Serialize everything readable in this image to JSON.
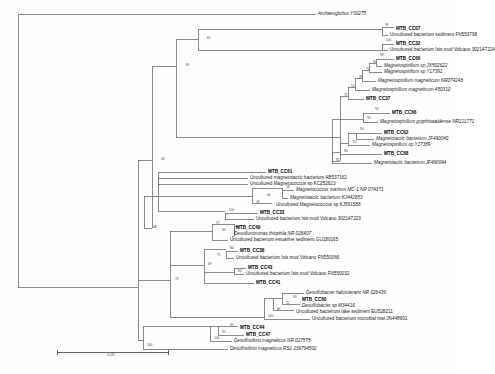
{
  "figure": {
    "type": "phylogenetic-tree",
    "title": "",
    "caption": "",
    "scale_bar": {
      "label": "0.05",
      "x1": 57,
      "x2": 168,
      "y": 352
    },
    "line_color": "#6e6e6e",
    "text_color": "#1a1a1a"
  },
  "chart_data": {
    "type": "tree",
    "title": "",
    "xlabel": "",
    "ylabel": "",
    "scale_bar_value": "0.05",
    "leaf_count": 34,
    "taxa": [
      {
        "id": "t1",
        "label": "Archaeoglobus Y00275",
        "bold": false,
        "italic": true,
        "x": 318,
        "y": 14
      },
      {
        "id": "t2",
        "label": "MTB_CC07",
        "bold": true,
        "italic": false,
        "x": 396,
        "y": 29
      },
      {
        "id": "t3",
        "label": "Uncultured bacterium sediment FN553798",
        "bold": false,
        "italic": false,
        "x": 390,
        "y": 35
      },
      {
        "id": "t4",
        "label": "MTB_CC32",
        "bold": true,
        "italic": false,
        "x": 396,
        "y": 44
      },
      {
        "id": "t5",
        "label": "Uncultured bacterium Isis mud Volcano 302147224",
        "bold": false,
        "italic": false,
        "x": 390,
        "y": 50
      },
      {
        "id": "t6",
        "label": "MTB_CC66",
        "bold": true,
        "italic": false,
        "x": 396,
        "y": 59
      },
      {
        "id": "t7",
        "label": "Magnetospirillum sp JX502622",
        "bold": false,
        "italic": true,
        "x": 384,
        "y": 66
      },
      {
        "id": "t8",
        "label": "Magnetospirillum sp Y17391",
        "bold": false,
        "italic": true,
        "x": 384,
        "y": 72
      },
      {
        "id": "t9",
        "label": "Magnetospirillum magneticum NR074248",
        "bold": false,
        "italic": true,
        "x": 378,
        "y": 81
      },
      {
        "id": "t10",
        "label": "Magnetospirillum magneticum 450310",
        "bold": false,
        "italic": true,
        "x": 372,
        "y": 90
      },
      {
        "id": "t11",
        "label": "MTB_CC37",
        "bold": true,
        "italic": false,
        "x": 366,
        "y": 99
      },
      {
        "id": "t12",
        "label": "MTB_CC66",
        "bold": true,
        "italic": false,
        "x": 392,
        "y": 113
      },
      {
        "id": "t13",
        "label": "Magnetospirillum gryphiswaldense NR121771",
        "bold": false,
        "italic": true,
        "x": 380,
        "y": 122
      },
      {
        "id": "t14",
        "label": "MTB_CC62",
        "bold": true,
        "italic": false,
        "x": 384,
        "y": 133
      },
      {
        "id": "t15",
        "label": "Magnetotactic bacterium JF490040",
        "bold": false,
        "italic": true,
        "x": 376,
        "y": 139
      },
      {
        "id": "t16",
        "label": "Magnetospirillum sp Y17389",
        "bold": false,
        "italic": true,
        "x": 372,
        "y": 145
      },
      {
        "id": "t17",
        "label": "MTB_CC68",
        "bold": true,
        "italic": false,
        "x": 384,
        "y": 154
      },
      {
        "id": "t18",
        "label": "Magnetotactic bacterium JF490044",
        "bold": false,
        "italic": true,
        "x": 374,
        "y": 163
      },
      {
        "id": "t19",
        "label": "MTB_CC61",
        "bold": true,
        "italic": false,
        "x": 268,
        "y": 172
      },
      {
        "id": "t20",
        "label": "Uncultured magnetotactic bacterium AB537162",
        "bold": false,
        "italic": false,
        "x": 250,
        "y": 178
      },
      {
        "id": "t21",
        "label": "Uncultured Magnetococcus sp KC252623",
        "bold": false,
        "italic": false,
        "x": 250,
        "y": 184
      },
      {
        "id": "t22",
        "label": "Magnetococcus marinus MC-1 NR 074371",
        "bold": false,
        "italic": true,
        "x": 296,
        "y": 190
      },
      {
        "id": "t23",
        "label": "Magnetotactic bacterium KJ442653",
        "bold": false,
        "italic": true,
        "x": 290,
        "y": 198
      },
      {
        "id": "t24",
        "label": "Uncultured Magnetococcus sp KJ591588",
        "bold": false,
        "italic": false,
        "x": 276,
        "y": 205
      },
      {
        "id": "t25",
        "label": "MTB_CC33",
        "bold": true,
        "italic": false,
        "x": 260,
        "y": 213
      },
      {
        "id": "t26",
        "label": "Uncultured bacterium Isis mud Volcano 302147223",
        "bold": false,
        "italic": false,
        "x": 256,
        "y": 219
      },
      {
        "id": "t27",
        "label": "MTB_CC49",
        "bold": true,
        "italic": false,
        "x": 236,
        "y": 228
      },
      {
        "id": "t28",
        "label": "Desulfuromonas thiophila NR 026407",
        "bold": false,
        "italic": true,
        "x": 234,
        "y": 234
      },
      {
        "id": "t29",
        "label": "Uncultured bacterium estuarine sediment GU180165",
        "bold": false,
        "italic": false,
        "x": 230,
        "y": 240
      },
      {
        "id": "t30",
        "label": "MTB_CC38",
        "bold": true,
        "italic": false,
        "x": 240,
        "y": 251
      },
      {
        "id": "t31",
        "label": "Uncultured bacterium Isis mud Volcano FN550066",
        "bold": false,
        "italic": false,
        "x": 236,
        "y": 258
      },
      {
        "id": "t32",
        "label": "MTB_CC43",
        "bold": true,
        "italic": false,
        "x": 248,
        "y": 268
      },
      {
        "id": "t33",
        "label": "Uncultured bacterium Isis mud Volcano FN550032",
        "bold": false,
        "italic": false,
        "x": 246,
        "y": 274
      },
      {
        "id": "t34",
        "label": "MTB_CC41",
        "bold": true,
        "italic": false,
        "x": 256,
        "y": 283
      },
      {
        "id": "t35",
        "label": "Desulfobacter halotolerans NR 026439",
        "bold": false,
        "italic": true,
        "x": 306,
        "y": 293
      },
      {
        "id": "t36",
        "label": "MTB_CC60",
        "bold": true,
        "italic": false,
        "x": 302,
        "y": 300
      },
      {
        "id": "t37",
        "label": "Desulfobacter sp M34416",
        "bold": false,
        "italic": true,
        "x": 302,
        "y": 306
      },
      {
        "id": "t38",
        "label": "Uncultured bacterium lake sediment EU528211",
        "bold": false,
        "italic": false,
        "x": 296,
        "y": 312
      },
      {
        "id": "t39",
        "label": "Uncultured bacterium microbial mat JN448901",
        "bold": false,
        "italic": false,
        "x": 312,
        "y": 319
      },
      {
        "id": "t40",
        "label": "MTB_CC44",
        "bold": true,
        "italic": false,
        "x": 240,
        "y": 328
      },
      {
        "id": "t41",
        "label": "MTB_CC47",
        "bold": true,
        "italic": false,
        "x": 246,
        "y": 335
      },
      {
        "id": "t42",
        "label": "Desulfovibrio magneticus NR 027575",
        "bold": false,
        "italic": true,
        "x": 234,
        "y": 341
      },
      {
        "id": "t43",
        "label": "Desulfovibrio magneticus RS1 239794502",
        "bold": false,
        "italic": true,
        "x": 230,
        "y": 349
      }
    ],
    "bootstrap_labels": [
      {
        "value": "99",
        "x": 385,
        "y": 26
      },
      {
        "value": "61",
        "x": 207,
        "y": 39
      },
      {
        "value": "100",
        "x": 386,
        "y": 41
      },
      {
        "value": "98",
        "x": 380,
        "y": 56
      },
      {
        "value": "65",
        "x": 373,
        "y": 63
      },
      {
        "value": "70",
        "x": 366,
        "y": 70
      },
      {
        "value": "85",
        "x": 186,
        "y": 66
      },
      {
        "value": "39",
        "x": 359,
        "y": 78
      },
      {
        "value": "52",
        "x": 351,
        "y": 87
      },
      {
        "value": "72",
        "x": 344,
        "y": 96
      },
      {
        "value": "99",
        "x": 375,
        "y": 110
      },
      {
        "value": "30",
        "x": 367,
        "y": 119
      },
      {
        "value": "90",
        "x": 360,
        "y": 130
      },
      {
        "value": "55",
        "x": 353,
        "y": 143
      },
      {
        "value": "96",
        "x": 344,
        "y": 152
      },
      {
        "value": "81",
        "x": 336,
        "y": 161
      },
      {
        "value": "44",
        "x": 161,
        "y": 160
      },
      {
        "value": "56",
        "x": 286,
        "y": 188
      },
      {
        "value": "60",
        "x": 267,
        "y": 196
      },
      {
        "value": "58",
        "x": 256,
        "y": 203
      },
      {
        "value": "100",
        "x": 229,
        "y": 211
      },
      {
        "value": "97",
        "x": 216,
        "y": 224
      },
      {
        "value": "83",
        "x": 222,
        "y": 231
      },
      {
        "value": "48",
        "x": 153,
        "y": 228
      },
      {
        "value": "84",
        "x": 230,
        "y": 249
      },
      {
        "value": "71",
        "x": 217,
        "y": 256
      },
      {
        "value": "69",
        "x": 208,
        "y": 265
      },
      {
        "value": "84",
        "x": 238,
        "y": 272
      },
      {
        "value": "74",
        "x": 175,
        "y": 280
      },
      {
        "value": "63",
        "x": 293,
        "y": 298
      },
      {
        "value": "51",
        "x": 286,
        "y": 304
      },
      {
        "value": "66",
        "x": 277,
        "y": 310
      },
      {
        "value": "100",
        "x": 268,
        "y": 317
      },
      {
        "value": "85",
        "x": 230,
        "y": 326
      },
      {
        "value": "95",
        "x": 222,
        "y": 333
      },
      {
        "value": "100",
        "x": 214,
        "y": 339
      },
      {
        "value": "100",
        "x": 147,
        "y": 346
      }
    ]
  }
}
